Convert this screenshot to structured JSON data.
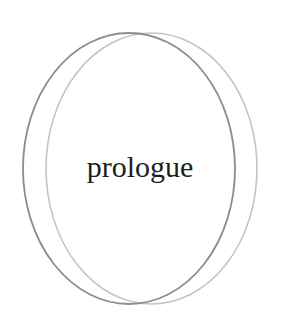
{
  "logo": {
    "word": "prologue",
    "colors": {
      "background": "#ffffff",
      "text": "#1e1e1e",
      "ring_dark": "#8c8c8c",
      "ring_light": "#c4c4c4"
    }
  }
}
